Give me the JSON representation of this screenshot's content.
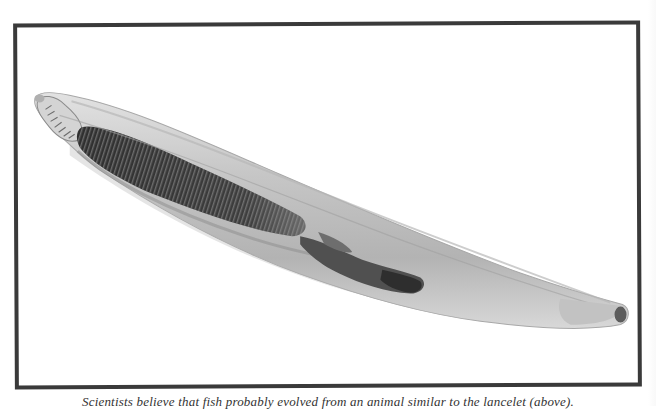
{
  "figure": {
    "frame_color": "#3a3a3a",
    "background_color": "#ffffff",
    "specimen": {
      "body_fill": "#c9c9c9",
      "body_edge": "#9a9a9a",
      "gill_region_color": "#3c3c3c",
      "gut_color": "#454545",
      "tail_tip_color": "#5a5a5a"
    }
  },
  "caption": {
    "text": "Scientists believe that fish probably evolved from an animal similar to the lancelet (above)."
  }
}
